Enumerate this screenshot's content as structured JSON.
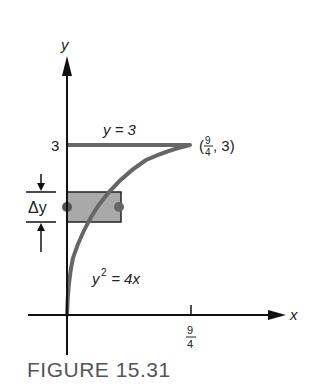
{
  "figure": {
    "caption": "FIGURE 15.31",
    "axes": {
      "x_label": "x",
      "y_label": "y",
      "x_tick_num": "9",
      "x_tick_den": "4",
      "y_tick": "3"
    },
    "labels": {
      "line_label": "y = 3",
      "curve_label_base": "y",
      "curve_label_exp": "2",
      "curve_label_rest": " = 4x",
      "point_open": "(",
      "point_num": "9",
      "point_den": "4",
      "point_rest": ", 3)",
      "delta_label": "Δy"
    },
    "colors": {
      "axis": "#111111",
      "curve": "#666666",
      "strip_fill": "#a9a9a9",
      "strip_stroke": "#222222",
      "caption": "#555555"
    }
  }
}
